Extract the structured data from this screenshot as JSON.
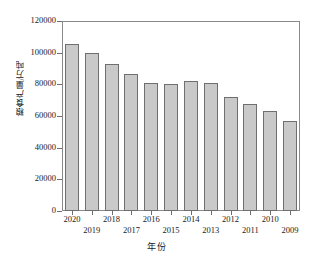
{
  "chart_data": {
    "type": "bar",
    "title": "",
    "xlabel": "年份",
    "ylabel": "粮食产量/万吨",
    "categories": [
      "2020",
      "2019",
      "2018",
      "2017",
      "2016",
      "2015",
      "2014",
      "2013",
      "2012",
      "2011",
      "2010",
      "2009"
    ],
    "values": [
      105300,
      99900,
      93000,
      86800,
      80800,
      80500,
      82000,
      80700,
      72300,
      67800,
      63000,
      56700
    ],
    "ylim": [
      0,
      120000
    ],
    "yticks": [
      0,
      20000,
      40000,
      60000,
      80000,
      100000,
      120000
    ],
    "ytick_labels": [
      "0",
      "20000",
      "40000",
      "60000",
      "80000",
      "100000",
      "120000"
    ],
    "grid": false,
    "legend": null,
    "bar_fill_color": "#c9c9c9",
    "bar_edge_color": "#6f6f6f",
    "axis_color": "#8a8a8a",
    "text_color": "#1a1a1a"
  }
}
